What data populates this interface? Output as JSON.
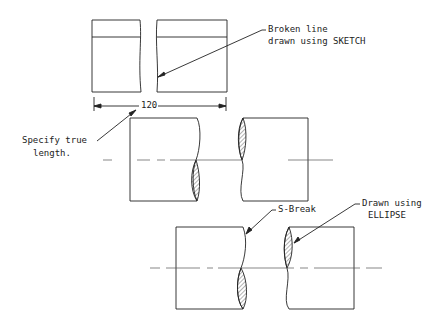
{
  "annotations": {
    "broken_line": [
      "Broken line",
      "drawn using SKETCH"
    ],
    "dimension": "120",
    "specify": [
      "Specify true",
      "length."
    ],
    "s_break": "S-Break",
    "ellipse": [
      "Drawn using",
      "ELLIPSE"
    ]
  },
  "colors": {
    "line": "#222222",
    "centerline": "#555555"
  }
}
